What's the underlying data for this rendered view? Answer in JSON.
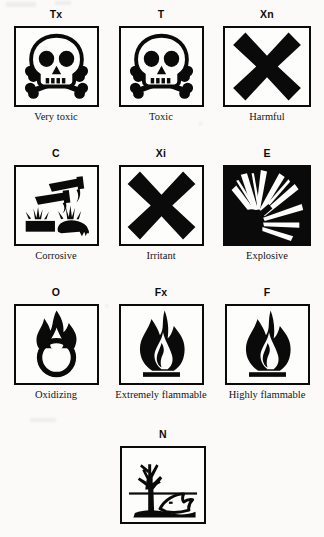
{
  "document": {
    "title": "Hazard warning symbols",
    "background_color": "#fbfaf8",
    "ink_color": "#0a0a0a"
  },
  "rows": [
    {
      "symbols": [
        {
          "code": "Tx",
          "caption": "Very toxic",
          "icon": "skull-and-crossbones-icon"
        },
        {
          "code": "T",
          "caption": "Toxic",
          "icon": "skull-and-crossbones-icon"
        },
        {
          "code": "Xn",
          "caption": "Harmful",
          "icon": "saltire-cross-icon"
        }
      ]
    },
    {
      "symbols": [
        {
          "code": "C",
          "caption": "Corrosive",
          "icon": "corrosion-test-tubes-icon"
        },
        {
          "code": "Xi",
          "caption": "Irritant",
          "icon": "saltire-cross-icon"
        },
        {
          "code": "E",
          "caption": "Explosive",
          "icon": "exploding-bomb-icon"
        }
      ]
    },
    {
      "symbols": [
        {
          "code": "O",
          "caption": "Oxidizing",
          "icon": "flame-over-circle-icon"
        },
        {
          "code": "Fx",
          "caption": "Extremely flammable",
          "icon": "flame-icon"
        },
        {
          "code": "F",
          "caption": "Highly flammable",
          "icon": "flame-icon"
        }
      ]
    },
    {
      "symbols": [
        {
          "code": "N",
          "caption": "",
          "icon": "dead-tree-and-fish-icon"
        }
      ]
    }
  ]
}
